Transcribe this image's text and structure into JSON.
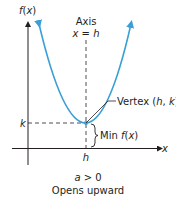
{
  "diagram": {
    "y_axis_label": "f(x)",
    "x_axis_label": "x",
    "axis_of_symmetry": {
      "title": "Axis",
      "equation": "x = h"
    },
    "vertex_label": "Vertex (h, k)",
    "k_label": "k",
    "h_label": "h",
    "min_label": "Min f(x)",
    "condition": "a > 0",
    "caption": "Opens upward",
    "colors": {
      "curve": "#3a9fd6",
      "axes": "#231f20",
      "text": "#231f20"
    }
  }
}
